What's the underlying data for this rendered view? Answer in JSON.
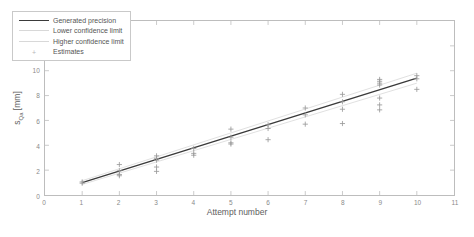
{
  "chart_data": {
    "type": "scatter",
    "title": "",
    "xlabel": "Attempt number",
    "ylabel": "s_Qa [mm]",
    "ylabel_main": "s",
    "ylabel_sub": "Qa",
    "ylabel_unit": " [mm]",
    "xlim": [
      0,
      11
    ],
    "ylim": [
      0,
      14
    ],
    "xticks": [
      0,
      1,
      2,
      3,
      4,
      5,
      6,
      7,
      8,
      9,
      10,
      11
    ],
    "yticks": [
      0,
      2,
      4,
      6,
      8,
      10,
      12,
      14
    ],
    "grid": false,
    "legend_position": "top-left-inside",
    "legend": [
      {
        "label": "Generated precision",
        "marker": "line",
        "color": "#3a3a3a"
      },
      {
        "label": "Lower confidence limit",
        "marker": "line",
        "color": "#d8d8d8"
      },
      {
        "label": "Higher confidence limit",
        "marker": "line",
        "color": "#d8d8d8"
      },
      {
        "label": "Estimates",
        "marker": "plus",
        "color": "#b0b0b0"
      }
    ],
    "series": [
      {
        "name": "Generated precision",
        "type": "line",
        "color": "#3a3a3a",
        "x": [
          1,
          10
        ],
        "y": [
          1.0,
          9.4
        ]
      },
      {
        "name": "Lower confidence limit",
        "type": "line",
        "color": "#dcdcdc",
        "x": [
          1,
          10
        ],
        "y": [
          0.85,
          9.0
        ]
      },
      {
        "name": "Higher confidence limit",
        "type": "line",
        "color": "#dcdcdc",
        "x": [
          1,
          10
        ],
        "y": [
          1.15,
          9.8
        ]
      },
      {
        "name": "Estimates",
        "type": "scatter",
        "marker": "+",
        "color": "#9a9a9a",
        "points": [
          [
            1,
            1.05
          ],
          [
            1,
            0.95
          ],
          [
            2,
            2.45
          ],
          [
            2,
            1.95
          ],
          [
            2,
            1.65
          ],
          [
            2,
            1.55
          ],
          [
            3,
            3.15
          ],
          [
            3,
            2.95
          ],
          [
            3,
            2.8
          ],
          [
            3,
            2.25
          ],
          [
            3,
            1.9
          ],
          [
            4,
            3.75
          ],
          [
            4,
            3.35
          ],
          [
            4,
            3.2
          ],
          [
            5,
            5.3
          ],
          [
            5,
            4.65
          ],
          [
            5,
            4.2
          ],
          [
            5,
            4.1
          ],
          [
            6,
            5.65
          ],
          [
            6,
            5.35
          ],
          [
            6,
            4.45
          ],
          [
            7,
            7.0
          ],
          [
            7,
            6.45
          ],
          [
            7,
            5.7
          ],
          [
            8,
            8.1
          ],
          [
            8,
            7.5
          ],
          [
            8,
            6.9
          ],
          [
            8,
            5.75
          ],
          [
            9,
            9.3
          ],
          [
            9,
            9.15
          ],
          [
            9,
            9.0
          ],
          [
            9,
            8.85
          ],
          [
            9,
            7.8
          ],
          [
            9,
            7.25
          ],
          [
            9,
            6.85
          ],
          [
            10,
            9.6
          ],
          [
            10,
            9.35
          ],
          [
            10,
            8.5
          ]
        ]
      }
    ]
  },
  "axis": {
    "x_tick_labels": [
      "0",
      "1",
      "2",
      "3",
      "4",
      "5",
      "6",
      "7",
      "8",
      "9",
      "10",
      "11"
    ],
    "y_tick_labels": [
      "0",
      "2",
      "4",
      "6",
      "8",
      "10",
      "12",
      "14"
    ]
  },
  "colors": {
    "main_line": "#3a3a3a",
    "confidence_line": "#dcdcdc",
    "marker": "#9a9a9a",
    "axis": "#bdbdbd",
    "text": "#5d5d5d",
    "background": "#ffffff"
  }
}
